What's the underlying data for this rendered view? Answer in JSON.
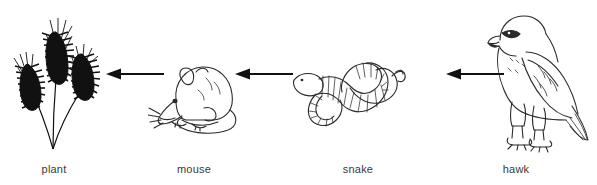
{
  "diagram": {
    "background_color": "#ffffff",
    "ink_color": "#1a1a1a",
    "label_color": "#3a3a3a",
    "width": 597,
    "height": 185
  },
  "nodes": [
    {
      "id": "plant",
      "label": "plant",
      "icon": "wheat-plant-icon",
      "order": 1
    },
    {
      "id": "mouse",
      "label": "mouse",
      "icon": "mouse-icon",
      "order": 2
    },
    {
      "id": "snake",
      "label": "snake",
      "icon": "snake-icon",
      "order": 3
    },
    {
      "id": "hawk",
      "label": "hawk",
      "icon": "hawk-icon",
      "order": 4
    }
  ],
  "arrows": [
    {
      "id": "arrow-1",
      "from": "mouse",
      "to": "plant",
      "direction": "left",
      "style": "solid-filled-head"
    },
    {
      "id": "arrow-2",
      "from": "snake",
      "to": "mouse",
      "direction": "left",
      "style": "solid-filled-head"
    },
    {
      "id": "arrow-3",
      "from": "hawk",
      "to": "snake",
      "direction": "left",
      "style": "solid-filled-head"
    }
  ]
}
